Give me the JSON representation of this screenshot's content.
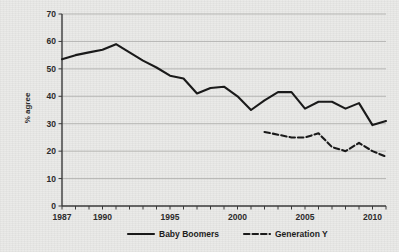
{
  "chart_data": {
    "type": "line",
    "title": "",
    "subtitle": "",
    "xlabel": "",
    "ylabel": "% agree",
    "xlim": [
      1987,
      2011
    ],
    "ylim": [
      0,
      70
    ],
    "yticks": [
      0,
      10,
      20,
      30,
      40,
      50,
      60,
      70
    ],
    "ytick_labels": [
      "0",
      "10",
      "20",
      "30",
      "40",
      "50",
      "60",
      "70"
    ],
    "xticks": [
      1987,
      1990,
      1995,
      2000,
      2005,
      2010
    ],
    "xtick_labels": [
      "1987",
      "1990",
      "1995",
      "2000",
      "2005",
      "2010"
    ],
    "grid": "horizontal",
    "legend_position": "bottom-center",
    "series": [
      {
        "name": "Baby Boomers",
        "style": "solid",
        "color": "#1a1a1a",
        "x": [
          1987,
          1988,
          1989,
          1990,
          1991,
          1992,
          1993,
          1994,
          1995,
          1996,
          1997,
          1998,
          1999,
          2000,
          2001,
          2002,
          2003,
          2004,
          2005,
          2006,
          2007,
          2008,
          2009,
          2010,
          2011
        ],
        "values": [
          53.5,
          55,
          56,
          57,
          59,
          56,
          53,
          50.5,
          47.5,
          46.5,
          41,
          43,
          43.5,
          40,
          35,
          38.5,
          41.5,
          41.5,
          35.5,
          38,
          38,
          35.5,
          37.5,
          29.5,
          31
        ]
      },
      {
        "name": "Generation Y",
        "style": "dashed",
        "color": "#1a1a1a",
        "x": [
          2002,
          2003,
          2004,
          2005,
          2006,
          2007,
          2008,
          2009,
          2010,
          2011
        ],
        "values": [
          27,
          26,
          25,
          25,
          26.5,
          21.5,
          20,
          23,
          20,
          18
        ]
      }
    ]
  },
  "legend": {
    "items": [
      {
        "label": "Baby Boomers",
        "style": "solid"
      },
      {
        "label": "Generation Y",
        "style": "dashed"
      }
    ]
  },
  "axis": {
    "y_title": "% agree"
  }
}
